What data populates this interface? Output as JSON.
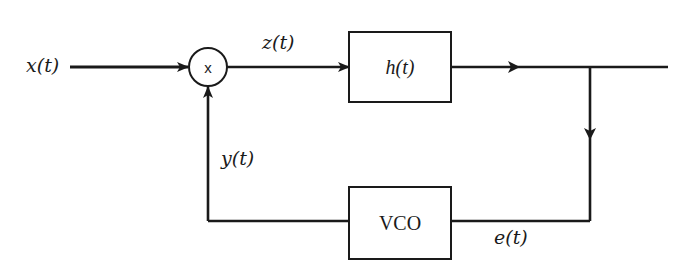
{
  "diagram": {
    "title": "",
    "colors": {
      "stroke": "#1a1a1a",
      "background": "#ffffff"
    },
    "nodes": {
      "multiplier": {
        "label": "x",
        "shape": "circle"
      },
      "filter": {
        "label": "h(t)",
        "shape": "rectangle"
      },
      "vco": {
        "label": "VCO",
        "shape": "rectangle"
      }
    },
    "signals": {
      "input": "x(t)",
      "mixer_output": "z(t)",
      "vco_output": "y(t)",
      "error": "e(t)"
    },
    "edges": [
      {
        "from": "input",
        "to": "multiplier",
        "label": "x(t)"
      },
      {
        "from": "multiplier",
        "to": "filter",
        "label": "z(t)"
      },
      {
        "from": "filter",
        "to": "output",
        "label": ""
      },
      {
        "from": "filter-output-junction",
        "to": "vco",
        "label": "e(t)"
      },
      {
        "from": "vco",
        "to": "multiplier",
        "label": "y(t)"
      }
    ]
  }
}
